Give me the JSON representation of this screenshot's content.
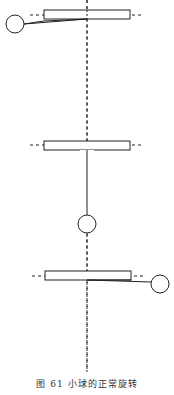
{
  "figure": {
    "caption": "图 61   小球的正常旋转",
    "panels": [
      {
        "state": "ball-left",
        "label": "rotation position 1"
      },
      {
        "state": "ball-down",
        "label": "rotation position 2"
      },
      {
        "state": "ball-right",
        "label": "rotation position 3"
      }
    ]
  },
  "colors": {
    "stroke": "#222222",
    "background": "#ffffff"
  }
}
